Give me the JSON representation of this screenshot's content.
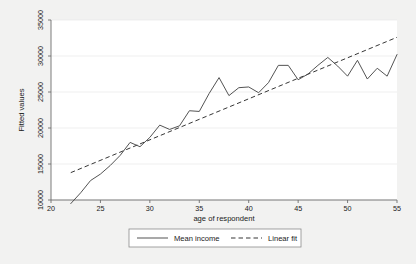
{
  "chart_data": {
    "type": "line",
    "title": "",
    "xlabel": "age of respondent",
    "ylabel": "Fitted values",
    "xlim": [
      20,
      55
    ],
    "ylim": [
      10000,
      35000
    ],
    "xticks": [
      20,
      25,
      30,
      35,
      40,
      45,
      50,
      55
    ],
    "yticks": [
      10000,
      15000,
      20000,
      25000,
      30000,
      35000
    ],
    "xtick_labels": [
      "20",
      "25",
      "30",
      "35",
      "40",
      "45",
      "50",
      "55"
    ],
    "ytick_labels": [
      "10000",
      "15000",
      "20000",
      "25000",
      "30000",
      "35000"
    ],
    "grid": true,
    "legend_position": "bottom-center",
    "x": [
      22,
      23,
      24,
      25,
      26,
      27,
      28,
      29,
      30,
      31,
      32,
      33,
      34,
      35,
      36,
      37,
      38,
      39,
      40,
      41,
      42,
      43,
      44,
      45,
      46,
      47,
      48,
      49,
      50,
      51,
      52,
      53,
      54,
      55
    ],
    "series": [
      {
        "name": "Mean income",
        "style": "solid",
        "values": [
          9500,
          11000,
          12700,
          13600,
          14800,
          16200,
          18000,
          17400,
          18700,
          20400,
          19800,
          20300,
          22400,
          22300,
          24800,
          27000,
          24500,
          25600,
          25700,
          24900,
          26300,
          28700,
          28700,
          26700,
          27500,
          28700,
          29800,
          28600,
          27200,
          29400,
          26800,
          28300,
          27200,
          30200
        ]
      },
      {
        "name": "Linear fit",
        "style": "dashed",
        "x": [
          22,
          55
        ],
        "values": [
          13800,
          32600
        ]
      }
    ],
    "legend": [
      {
        "label": "Mean income",
        "style": "solid"
      },
      {
        "label": "Linear fit",
        "style": "dashed"
      }
    ]
  }
}
